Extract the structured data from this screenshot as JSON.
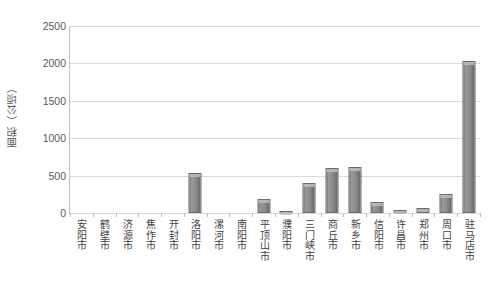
{
  "chart_data": {
    "type": "bar",
    "title": "",
    "xlabel": "",
    "ylabel": "面积（公顷）",
    "ylim": [
      0,
      2500
    ],
    "ytick_labels": [
      "2500",
      "2000",
      "1500",
      "1000",
      "500",
      "0"
    ],
    "yticks": [
      2500,
      2000,
      1500,
      1000,
      500,
      0
    ],
    "grid": true,
    "legend": false,
    "series_name": "面积",
    "categories": [
      "安阳市",
      "鹤壁市",
      "济源市",
      "焦作市",
      "开封市",
      "洛阳市",
      "漯河市",
      "南阳市",
      "平顶山市",
      "濮阳市",
      "三门峡市",
      "商丘市",
      "新乡市",
      "信阳市",
      "许昌市",
      "郑州市",
      "周口市",
      "驻马店市"
    ],
    "values": [
      0,
      0,
      0,
      0,
      0,
      540,
      0,
      0,
      185,
      25,
      400,
      600,
      610,
      150,
      45,
      70,
      250,
      2030
    ]
  },
  "colors": {
    "bar_fill": "#8c8c8c",
    "bar_edge": "#6b6b6b",
    "gridline": "#d9d9d9",
    "axis": "#bfbfbf",
    "text": "#404040",
    "background": "#ffffff"
  }
}
